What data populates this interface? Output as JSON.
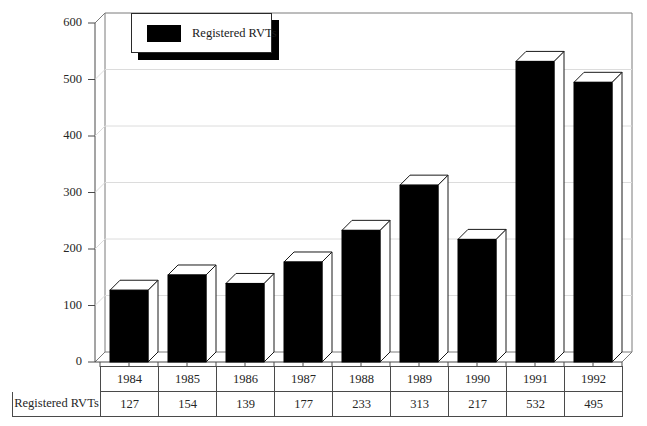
{
  "chart_data": {
    "type": "bar",
    "title": "",
    "subtitle": "",
    "xlabel": "",
    "ylabel": "",
    "categories": [
      "1984",
      "1985",
      "1986",
      "1987",
      "1988",
      "1989",
      "1990",
      "1991",
      "1992"
    ],
    "values": [
      127,
      154,
      139,
      177,
      233,
      313,
      217,
      532,
      495
    ],
    "series": [
      {
        "name": "Registered RVTs",
        "values": [
          127,
          154,
          139,
          177,
          233,
          313,
          217,
          532,
          495
        ]
      }
    ],
    "ylim": [
      0,
      600
    ],
    "ytick_labels": [
      "0",
      "100",
      "200",
      "300",
      "400",
      "500",
      "600"
    ],
    "ytick_values": [
      0,
      100,
      200,
      300,
      400,
      500,
      600
    ],
    "grid": true,
    "grid_axis": "y",
    "legend_position": "top-left-inside",
    "legend_entries": [
      "Registered RVTs"
    ],
    "style": "3d-column",
    "bar_color": "#000000",
    "bar_top_color": "#ffffff",
    "bar_side_color": "#ffffff",
    "grid_color": "#dcdcdc",
    "axis_color": "#4a4a4a"
  },
  "legend": {
    "label": "Registered RVTs",
    "swatch_color": "#000000"
  },
  "table": {
    "row_header": "Registered RVTs",
    "years": [
      "1984",
      "1985",
      "1986",
      "1987",
      "1988",
      "1989",
      "1990",
      "1991",
      "1992"
    ],
    "values": [
      "127",
      "154",
      "139",
      "177",
      "233",
      "313",
      "217",
      "532",
      "495"
    ]
  },
  "axis": {
    "y_labels": [
      "600",
      "500",
      "400",
      "300",
      "200",
      "100",
      "0"
    ]
  }
}
